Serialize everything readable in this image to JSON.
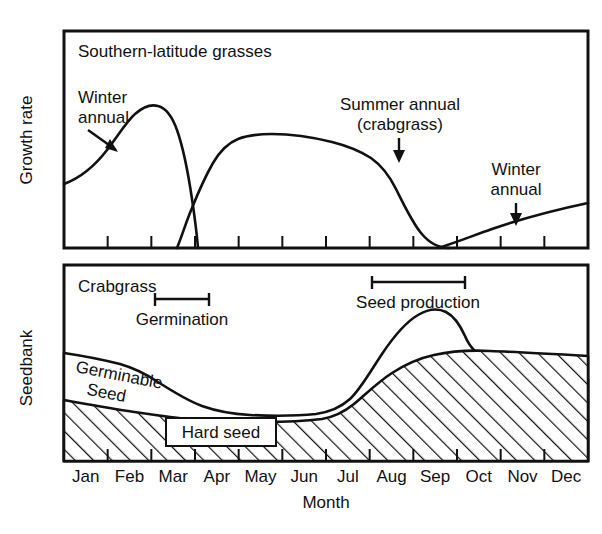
{
  "figure": {
    "months": [
      "Jan",
      "Feb",
      "Mar",
      "Apr",
      "May",
      "Jun",
      "Jul",
      "Aug",
      "Sep",
      "Oct",
      "Nov",
      "Dec"
    ],
    "x_axis_label": "Month"
  },
  "panel_top": {
    "title": "Southern-latitude grasses",
    "y_axis_label": "Growth rate",
    "annotations": [
      {
        "name": "winter-annual-left",
        "line1": "Winter",
        "line2": "annual"
      },
      {
        "name": "summer-annual",
        "line1": "Summer annual",
        "line2": "(crabgrass)"
      },
      {
        "name": "winter-annual-right",
        "line1": "Winter",
        "line2": "annual"
      }
    ]
  },
  "panel_bottom": {
    "y_axis_label": "Seedbank",
    "species_label": "Crabgrass",
    "germination_label": "Germination",
    "seed_production_label": "Seed production",
    "germinable_seed_label_line1": "Germinable",
    "germinable_seed_label_line2": "Seed",
    "hard_seed_label": "Hard seed"
  },
  "chart_data": [
    {
      "type": "line",
      "name": "growth-rate",
      "title": "Southern-latitude grasses",
      "xlabel": "Month",
      "ylabel": "Growth rate",
      "x": [
        "Jan",
        "Feb",
        "Mar",
        "Apr",
        "May",
        "Jun",
        "Jul",
        "Aug",
        "Sep",
        "Oct",
        "Nov",
        "Dec"
      ],
      "xlim": [
        0,
        12
      ],
      "ylim": [
        0,
        100
      ],
      "grid": false,
      "legend": "none",
      "series": [
        {
          "name": "Winter annual",
          "x": [
            0.0,
            0.6,
            1.2,
            1.7,
            2.0,
            2.4,
            2.8,
            3.1,
            3.35,
            3.55,
            3.75
          ],
          "values": [
            30,
            44,
            66,
            85,
            89,
            86,
            70,
            45,
            25,
            10,
            0
          ]
        },
        {
          "name": "Summer annual (crabgrass)",
          "x": [
            2.6,
            3.1,
            3.5,
            3.9,
            4.3,
            4.7,
            5.4,
            6.2,
            7.0,
            7.6,
            8.1,
            8.6,
            9.1,
            9.6,
            10.0,
            10.4
          ],
          "values": [
            0,
            14,
            34,
            57,
            74,
            81,
            83,
            81,
            78,
            74,
            66,
            52,
            36,
            20,
            8,
            0
          ]
        },
        {
          "name": "Winter annual (second cohort)",
          "x": [
            9.7,
            10.1,
            10.4,
            10.9,
            11.4,
            12.0
          ],
          "values": [
            0,
            3,
            6,
            12,
            19,
            26
          ]
        }
      ]
    },
    {
      "type": "area",
      "name": "seedbank",
      "xlabel": "Month",
      "ylabel": "Seedbank",
      "x": [
        "Jan",
        "Feb",
        "Mar",
        "Apr",
        "May",
        "Jun",
        "Jul",
        "Aug",
        "Sep",
        "Oct",
        "Nov",
        "Dec"
      ],
      "xlim": [
        0,
        12
      ],
      "ylim": [
        0,
        100
      ],
      "grid": false,
      "legend": "none",
      "series": [
        {
          "name": "Total seedbank (germinable + hard seed)",
          "x": [
            0.0,
            1.0,
            2.0,
            2.6,
            3.2,
            3.8,
            4.4,
            5.0,
            6.0,
            7.0,
            7.6,
            8.1,
            8.6,
            9.1,
            9.5,
            10.0,
            10.6,
            11.3,
            12.0
          ],
          "values": [
            55,
            52,
            49,
            46,
            41,
            33,
            26,
            22,
            20,
            20,
            22,
            32,
            52,
            70,
            80,
            83,
            76,
            69,
            63
          ]
        },
        {
          "name": "Hard seed",
          "x": [
            0.0,
            1.0,
            2.0,
            3.0,
            4.0,
            5.0,
            6.0,
            7.0,
            7.6,
            8.2,
            8.8,
            9.4,
            10.0,
            10.6,
            11.3,
            12.0
          ],
          "values": [
            31,
            27,
            23,
            20,
            17,
            15,
            14,
            14,
            15,
            20,
            31,
            42,
            50,
            52,
            52,
            51
          ]
        }
      ],
      "annotations": [
        {
          "name": "germination-bracket",
          "label": "Germination",
          "x_start": 2.1,
          "x_end": 3.9
        },
        {
          "name": "seed-production-bracket",
          "label": "Seed production",
          "x_start": 7.1,
          "x_end": 9.7
        }
      ]
    }
  ]
}
